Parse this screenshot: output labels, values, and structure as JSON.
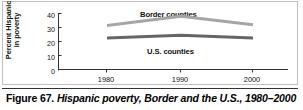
{
  "figure": {
    "caption_number": "Figure 67.",
    "caption_text": "Hispanic poverty, Border and the U.S., 1980–2000"
  },
  "chart_data": {
    "type": "line",
    "title": "",
    "xlabel": "",
    "ylabel": "Percent Hispanic in poverty",
    "ylabel_line1": "Percent Hispanic",
    "ylabel_line2": "in poverty",
    "x": [
      1980,
      1990,
      2000
    ],
    "xticklabels": [
      "1980",
      "1990",
      "2000"
    ],
    "yticklabels": [
      "0",
      "10",
      "20",
      "30",
      "40"
    ],
    "yticks": [
      0,
      10,
      20,
      30,
      40
    ],
    "ylim": [
      0,
      40
    ],
    "xlim": [
      1980,
      2000
    ],
    "grid": false,
    "legend": "inline-labels",
    "series": [
      {
        "name": "Border counties",
        "label": "Border counties",
        "color": "#a6a6a6",
        "values": [
          31.5,
          38.0,
          32.0
        ]
      },
      {
        "name": "U.S. counties",
        "label": "U.S. counties",
        "color": "#666666",
        "values": [
          22.5,
          24.5,
          22.5
        ]
      }
    ]
  }
}
